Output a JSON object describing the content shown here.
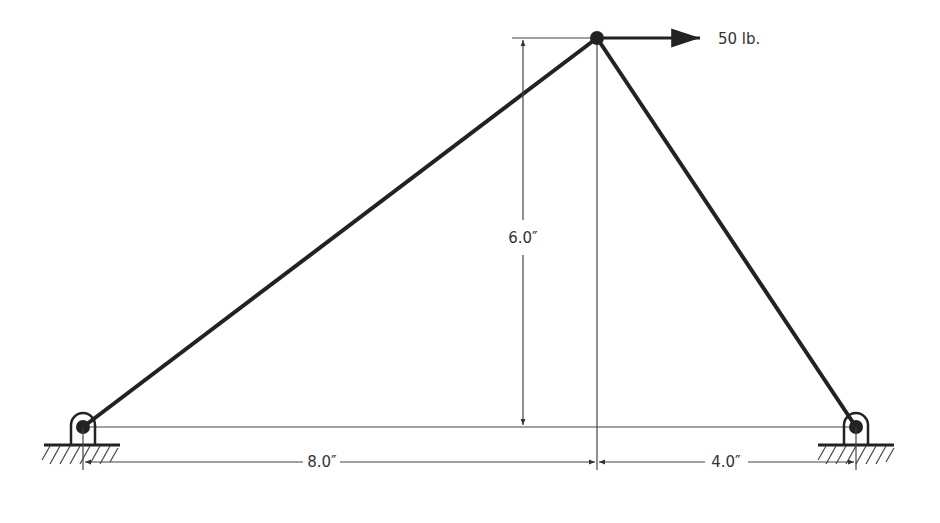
{
  "diagram": {
    "type": "two-member truss / frame",
    "colors": {
      "member": "#222222",
      "thin_line": "#444444",
      "text": "#333333",
      "background": "#ffffff"
    },
    "load": {
      "label": "50 lb.",
      "direction": "right",
      "applied_at": "apex"
    },
    "dimensions": {
      "height": "6.0″",
      "left_span": "8.0″",
      "right_span": "4.0″"
    },
    "supports": [
      {
        "id": "left",
        "type": "pin"
      },
      {
        "id": "right",
        "type": "pin"
      }
    ],
    "members": [
      {
        "id": "left-member",
        "from": "left-support",
        "to": "apex"
      },
      {
        "id": "right-member",
        "from": "right-support",
        "to": "apex"
      }
    ]
  }
}
